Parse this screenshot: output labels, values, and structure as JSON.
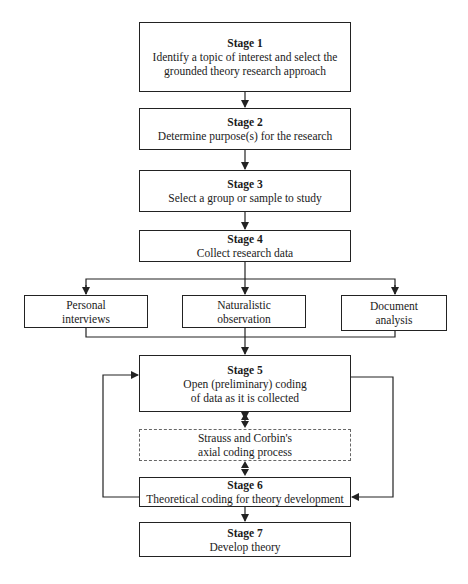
{
  "diagram": {
    "type": "flowchart",
    "stages": [
      {
        "id": "stage1",
        "title": "Stage 1",
        "lines": [
          "Identify a topic of interest and select the",
          "grounded theory research approach"
        ]
      },
      {
        "id": "stage2",
        "title": "Stage 2",
        "lines": [
          "Determine purpose(s) for the research"
        ]
      },
      {
        "id": "stage3",
        "title": "Stage 3",
        "lines": [
          "Select a group or sample to study"
        ]
      },
      {
        "id": "stage4",
        "title": "Stage 4",
        "lines": [
          "Collect research data"
        ]
      },
      {
        "id": "stage5",
        "title": "Stage 5",
        "lines": [
          "Open (preliminary) coding",
          "of data as it is collected"
        ]
      },
      {
        "id": "stage6",
        "title": "Stage 6",
        "lines": [
          "Theoretical coding for theory development"
        ]
      },
      {
        "id": "stage7",
        "title": "Stage 7",
        "lines": [
          "Develop theory"
        ]
      }
    ],
    "data_methods": [
      {
        "id": "personal",
        "lines": [
          "Personal",
          "interviews"
        ]
      },
      {
        "id": "naturalistic",
        "lines": [
          "Naturalistic",
          "observation"
        ]
      },
      {
        "id": "document",
        "lines": [
          "Document",
          "analysis"
        ]
      }
    ],
    "axial": {
      "lines": [
        "Strauss and Corbin's",
        "axial coding process"
      ],
      "style": "dashed"
    },
    "edges": [
      {
        "from": "stage1",
        "to": "stage2"
      },
      {
        "from": "stage2",
        "to": "stage3"
      },
      {
        "from": "stage3",
        "to": "stage4"
      },
      {
        "from": "stage4",
        "to": "personal"
      },
      {
        "from": "stage4",
        "to": "naturalistic"
      },
      {
        "from": "stage4",
        "to": "document"
      },
      {
        "from": "personal",
        "to": "stage5"
      },
      {
        "from": "naturalistic",
        "to": "stage5"
      },
      {
        "from": "document",
        "to": "stage5"
      },
      {
        "from": "stage5",
        "to": "axial",
        "bidirectional": true
      },
      {
        "from": "axial",
        "to": "stage6",
        "bidirectional": true
      },
      {
        "from": "stage6",
        "to": "stage5",
        "route": "left-loop"
      },
      {
        "from": "stage5",
        "to": "stage6",
        "route": "right-loop"
      },
      {
        "from": "stage6",
        "to": "stage7"
      }
    ]
  }
}
